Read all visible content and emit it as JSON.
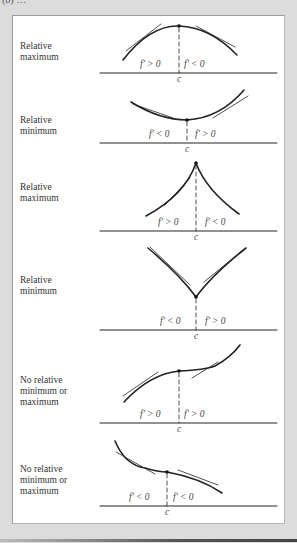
{
  "figure": {
    "tag": "(b) …",
    "panels": [
      {
        "label": "Relative\nmaximum",
        "left_sign": "f' > 0",
        "right_sign": "f' < 0",
        "point": "c",
        "type": "smooth-maximum"
      },
      {
        "label": "Relative\nminimum",
        "left_sign": "f' < 0",
        "right_sign": "f' > 0",
        "point": "c",
        "type": "smooth-minimum"
      },
      {
        "label": "Relative\nmaximum",
        "left_sign": "f' > 0",
        "right_sign": "f' < 0",
        "point": "c",
        "type": "cusp-maximum"
      },
      {
        "label": "Relative\nminimum",
        "left_sign": "f' < 0",
        "right_sign": "f' > 0",
        "point": "c",
        "type": "corner-minimum"
      },
      {
        "label": "No relative\nminimum or\nmaximum",
        "left_sign": "f' > 0",
        "right_sign": "f' > 0",
        "point": "c",
        "type": "increasing-inflection"
      },
      {
        "label": "No relative\nminimum or\nmaximum",
        "left_sign": "f' < 0",
        "right_sign": "f' < 0",
        "point": "c",
        "type": "decreasing-inflection"
      }
    ]
  },
  "colors": {
    "background": "#dcdcdc",
    "panel": "#ffffff",
    "ink": "#222222",
    "text": "#444444"
  }
}
